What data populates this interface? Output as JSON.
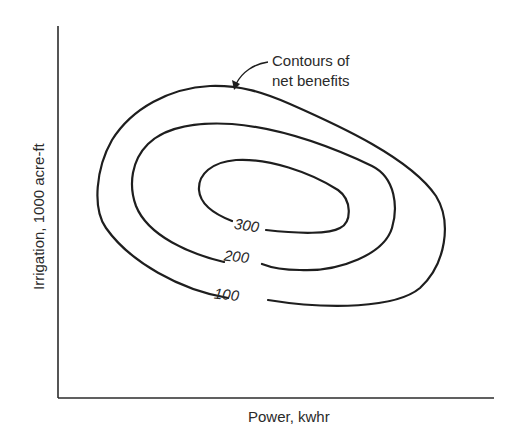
{
  "figure": {
    "type": "contour-diagram",
    "title": "",
    "xlabel": "Power, kwhr",
    "ylabel": "Irrigation, 1000 acre-ft",
    "annotation": {
      "line1": "Contours of",
      "line2": "net benefits"
    },
    "contours": [
      {
        "level": 100,
        "label": "100"
      },
      {
        "level": 200,
        "label": "200"
      },
      {
        "level": 300,
        "label": "300"
      }
    ],
    "axes": {
      "ticks": false,
      "grid": false
    },
    "colors": {
      "line": "#1e1e1e",
      "text": "#2a2a2a",
      "background": "#ffffff"
    }
  }
}
